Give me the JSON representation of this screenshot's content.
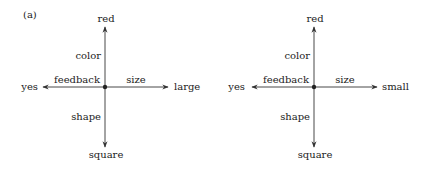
{
  "panel_label": "(a)",
  "diagrams": [
    {
      "id": "left",
      "top": "red",
      "bottom": "square",
      "left": "yes",
      "right": "large",
      "axis_labels": {
        "up": "color",
        "down": "shape",
        "left": "feedback",
        "right": "size"
      }
    },
    {
      "id": "right",
      "top": "red",
      "bottom": "square",
      "left": "yes",
      "right": "small",
      "axis_labels": {
        "up": "color",
        "down": "shape",
        "left": "feedback",
        "right": "size"
      }
    }
  ],
  "colors": {
    "line": "#333333",
    "text": "#222222"
  }
}
